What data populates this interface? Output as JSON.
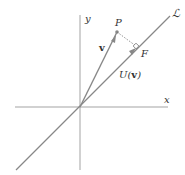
{
  "diagram": {
    "labels": {
      "x_axis": "x",
      "y_axis": "y",
      "line": "ℒ",
      "point_p": "P",
      "point_f": "F",
      "vector_v": "v",
      "projection": "U(v)",
      "projection_prefix": "U(",
      "projection_arg": "v",
      "projection_suffix": ")"
    },
    "colors": {
      "axes": "#8a8a8a",
      "vector": "#888888",
      "arrowhead": "#888888",
      "dotted": "#777777",
      "text": "#333333"
    },
    "geometry": {
      "origin": [
        80,
        107
      ],
      "P": [
        117,
        32
      ],
      "F": [
        137,
        47
      ],
      "line_start": [
        16,
        170
      ],
      "line_end": [
        170,
        16
      ]
    }
  }
}
